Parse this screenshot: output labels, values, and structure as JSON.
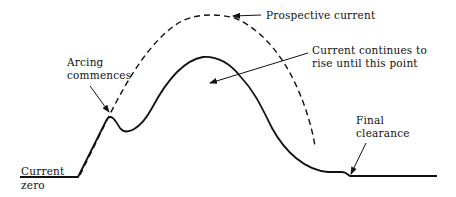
{
  "diagram": {
    "colors": {
      "stroke": "#111111",
      "background": "#ffffff"
    },
    "curves": [
      {
        "name": "actual-current",
        "style": "solid"
      },
      {
        "name": "prospective-current",
        "style": "dashed"
      }
    ],
    "labels": {
      "arcing": {
        "line1": "Arcing",
        "line2": "commences"
      },
      "prospective": {
        "text": "Prospective current"
      },
      "continues": {
        "line1": "Current continues to",
        "line2": "rise until this point"
      },
      "final": {
        "line1": "Final",
        "line2": "clearance"
      },
      "zero": {
        "line1": "Current",
        "line2": "zero"
      }
    }
  }
}
